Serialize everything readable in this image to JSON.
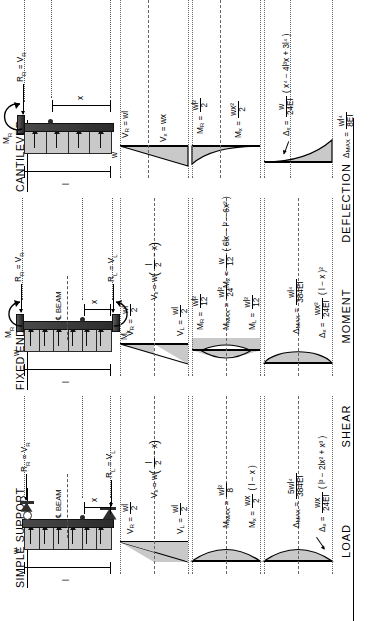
{
  "sheet": {
    "title": "Uniformly Distributed Load - Beam Diagrams and Formulas"
  },
  "row_labels": [
    {
      "key": "load",
      "label": "LOAD"
    },
    {
      "key": "shear",
      "label": "SHEAR"
    },
    {
      "key": "moment",
      "label": "MOMENT"
    },
    {
      "key": "deflection",
      "label": "DEFLECTION"
    }
  ],
  "columns": [
    {
      "key": "simple_support",
      "header": "SIMPLE SUPPORT",
      "load": {
        "load_symbol": "w",
        "span_symbol": "l",
        "distance_symbol": "x",
        "beam_label": "BEAM",
        "centerline_glyph": "℄",
        "left_reaction": "R",
        "left_reaction_sub": "L",
        "left_reaction_eq": "= V",
        "left_reaction_eq_sub": "L",
        "right_reaction": "R",
        "right_reaction_sub": "R",
        "right_reaction_eq": "= V",
        "right_reaction_eq_sub": "R",
        "left_support": "pin-support",
        "right_support": "roller-support"
      },
      "shear": {
        "left_value_var": "V",
        "left_value_sub": "L",
        "left_num": "wl",
        "left_den": "2",
        "right_value_var": "V",
        "right_value_sub": "R",
        "right_num": "wl",
        "right_den": "2",
        "general_var": "V",
        "general_sub": "x",
        "general_expr_lead": "= w",
        "general_frac_num": "l",
        "general_frac_den": "2",
        "general_expr_tail": "− x",
        "shape": "linear-crossing"
      },
      "moment": {
        "general_var": "M",
        "general_sub": "x",
        "general_frac_num": "wx",
        "general_frac_den": "2",
        "general_tail": "( l − x )",
        "max_var": "M",
        "max_sub": "MAX",
        "max_num": "wl²",
        "max_den": "8",
        "shape": "parabola-positive"
      },
      "deflection": {
        "general_var": "Δ",
        "general_sub": "x",
        "general_frac_num": "wx",
        "general_frac_den": "24EI",
        "general_tail": "( l³ − 2lx² + x³ )",
        "max_var": "Δ",
        "max_sub": "MAX",
        "max_num": "5wl⁴",
        "max_den": "384EI",
        "shape": "parabola-positive"
      }
    },
    {
      "key": "fixed_ends",
      "header": "FIXED ENDS",
      "load": {
        "load_symbol": "w",
        "span_symbol": "l",
        "distance_symbol": "x",
        "beam_label": "BEAM",
        "centerline_glyph": "℄",
        "left_reaction": "R",
        "left_reaction_sub": "L",
        "left_reaction_eq": "= V",
        "left_reaction_eq_sub": "L",
        "right_reaction": "R",
        "right_reaction_sub": "R",
        "right_reaction_eq": "= V",
        "right_reaction_eq_sub": "R",
        "left_moment": "M",
        "left_moment_sub": "L",
        "right_moment": "M",
        "right_moment_sub": "R",
        "left_support": "fixed-support",
        "right_support": "fixed-support"
      },
      "shear": {
        "left_value_var": "V",
        "left_value_sub": "L",
        "left_num": "wl",
        "left_den": "2",
        "right_value_var": "V",
        "right_value_sub": "R",
        "right_num": "wl",
        "right_den": "2",
        "general_var": "V",
        "general_sub": "x",
        "general_expr_lead": "= w",
        "general_frac_num": "l",
        "general_frac_den": "2",
        "general_expr_tail": "− x",
        "shape": "linear-crossing"
      },
      "moment": {
        "general_var": "M",
        "general_sub": "x",
        "general_frac_num": "w",
        "general_frac_den": "12",
        "general_tail": "( 6lx − l² − 6x² )",
        "end_var": "M",
        "end_sub": "L",
        "end_num": "wl²",
        "end_den": "12",
        "end_var_r": "M",
        "end_sub_r": "R",
        "end_num_r": "wl²",
        "end_den_r": "12",
        "max_var": "M",
        "max_sub": "MAX",
        "max_num": "wl²",
        "max_den": "24",
        "shape": "parabola-mixed"
      },
      "deflection": {
        "general_var": "Δ",
        "general_sub": "x",
        "general_frac_num": "wx²",
        "general_frac_den": "24EI",
        "general_tail": "( l − x )²",
        "max_var": "Δ",
        "max_sub": "MAX",
        "max_num": "wl⁴",
        "max_den": "384EI",
        "shape": "parabola-positive"
      }
    },
    {
      "key": "cantilever",
      "header": "CANTILEVER",
      "load": {
        "load_symbol": "w",
        "span_symbol": "l",
        "distance_symbol": "x",
        "right_reaction": "R",
        "right_reaction_sub": "R",
        "right_reaction_eq": "= V",
        "right_reaction_eq_sub": "R",
        "right_moment": "M",
        "right_moment_sub": "R",
        "right_support": "fixed-support",
        "free_end": "free-end"
      },
      "shear": {
        "right_value_var": "V",
        "right_value_sub": "R",
        "right_expr": "= wl",
        "general_var": "V",
        "general_sub": "x",
        "general_expr": "= wx",
        "shape": "linear-triangle"
      },
      "moment": {
        "general_var": "M",
        "general_sub": "x",
        "general_frac_num": "wx²",
        "general_frac_den": "2",
        "end_var": "M",
        "end_sub": "R",
        "end_num": "wl²",
        "end_den": "2",
        "shape": "parabola-cantilever"
      },
      "deflection": {
        "general_var": "Δ",
        "general_sub": "x",
        "general_frac_num": "w",
        "general_frac_den": "24EI",
        "general_tail": "( x⁴ − 4l³x + 3l⁴ )",
        "max_var": "Δ",
        "max_sub": "MAX",
        "max_num": "wl⁴",
        "max_den": "8EI",
        "shape": "cantilever-curve"
      }
    }
  ],
  "colors": {
    "fill": "#c9c9c9",
    "outline": "#000000",
    "beam_dark": "#2b2b2b",
    "grid": "#666666"
  }
}
